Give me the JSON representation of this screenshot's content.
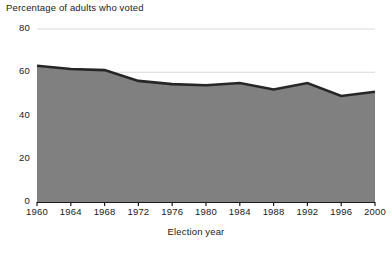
{
  "chart_data": {
    "type": "area",
    "title": "Percentage of adults who voted",
    "xlabel": "Election year",
    "ylabel": "Percentage of adults who voted",
    "categories": [
      "1960",
      "1964",
      "1968",
      "1972",
      "1976",
      "1980",
      "1984",
      "1988",
      "1992",
      "1996",
      "2000"
    ],
    "values": [
      63,
      61.5,
      61,
      56,
      54.5,
      54,
      55,
      52,
      55,
      49,
      51
    ],
    "x": [
      1960,
      1964,
      1968,
      1972,
      1976,
      1980,
      1984,
      1988,
      1992,
      1996,
      2000
    ],
    "xlim": [
      1960,
      2000
    ],
    "ylim": [
      0,
      80
    ],
    "yticks": [
      "0",
      "20",
      "40",
      "60",
      "80"
    ],
    "ytick_values": [
      0,
      20,
      40,
      60,
      80
    ],
    "xticks": [
      "1960",
      "1964",
      "1968",
      "1972",
      "1976",
      "1980",
      "1984",
      "1988",
      "1992",
      "1996",
      "2000"
    ],
    "grid": true,
    "legend": null,
    "colors": {
      "fill": "#808080",
      "line": "#262626",
      "grid": "#d9d9d9",
      "axis": "#1a1a1a",
      "background": "#ffffff"
    }
  },
  "axis_labels": {
    "y_title": "Percentage of adults who voted",
    "x_title": "Election year"
  }
}
